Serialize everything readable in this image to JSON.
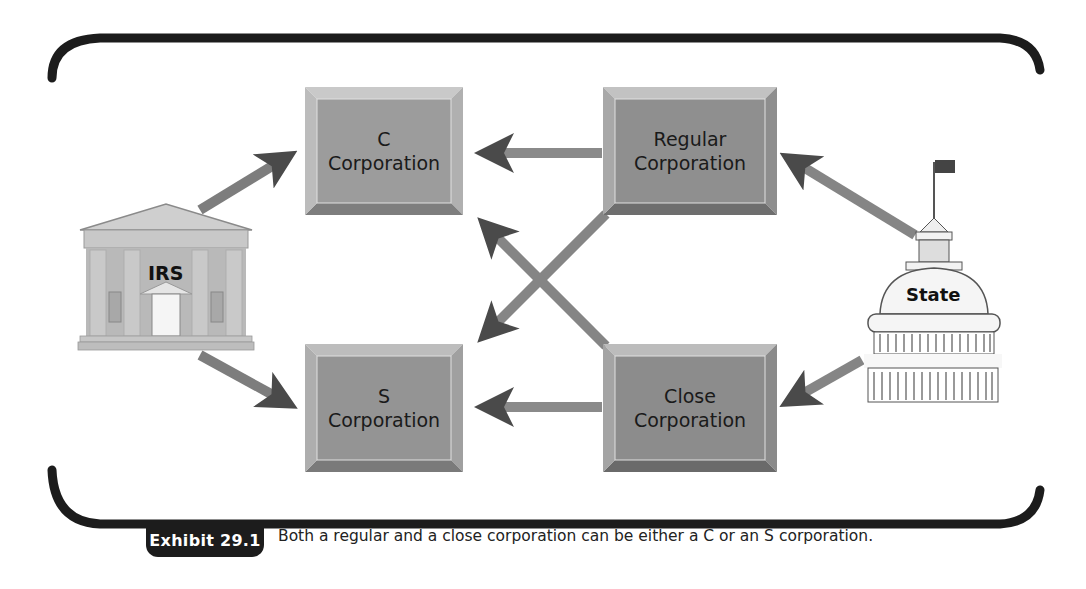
{
  "figure": {
    "exhibit_label": "Exhibit 29.1",
    "caption": "Both a regular and a close corporation can be either a C or an S corporation."
  },
  "nodes": {
    "c_corp": {
      "line1": "C",
      "line2": "Corporation"
    },
    "s_corp": {
      "line1": "S",
      "line2": "Corporation"
    },
    "regular_corp": {
      "line1": "Regular",
      "line2": "Corporation"
    },
    "close_corp": {
      "line1": "Close",
      "line2": "Corporation"
    },
    "irs": {
      "label": "IRS",
      "icon": "courthouse-building-icon"
    },
    "state": {
      "label": "State",
      "icon": "capitol-dome-icon"
    }
  },
  "edges": [
    {
      "from": "IRS",
      "to": "C Corporation"
    },
    {
      "from": "IRS",
      "to": "S Corporation"
    },
    {
      "from": "State",
      "to": "Regular Corporation"
    },
    {
      "from": "State",
      "to": "Close Corporation"
    },
    {
      "from": "Regular Corporation",
      "to": "C Corporation"
    },
    {
      "from": "Regular Corporation",
      "to": "S Corporation"
    },
    {
      "from": "Close Corporation",
      "to": "C Corporation"
    },
    {
      "from": "Close Corporation",
      "to": "S Corporation"
    }
  ],
  "colors": {
    "frame": "#1c1c1c",
    "box_fill": "#9a9a9a",
    "box_bevel_light": "#c4c4c4",
    "box_bevel_dark": "#7a7a7a",
    "arrow": "#6e6e6e",
    "arrow_head": "#4a4a4a"
  }
}
